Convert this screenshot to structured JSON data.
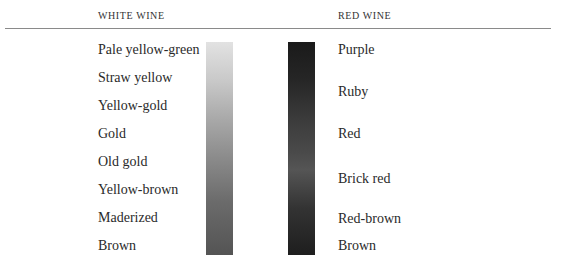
{
  "headers": {
    "white": "WHITE WINE",
    "red": "RED WINE"
  },
  "white_wine": {
    "labels": [
      "Pale yellow-green",
      "Straw yellow",
      "Yellow-gold",
      "Gold",
      "Old gold",
      "Yellow-brown",
      "Maderized",
      "Brown"
    ],
    "gradient_colors": [
      "#e2e2e2",
      "#c9c9c9",
      "#a9a9a9",
      "#8a8a8a",
      "#6b6b6b",
      "#545454"
    ]
  },
  "red_wine": {
    "labels": [
      "Purple",
      "Ruby",
      "Red",
      "Brick red",
      "Red-brown",
      "Brown"
    ],
    "gradient_colors": [
      "#1a1a1a",
      "#262626",
      "#3b3b3b",
      "#4a4a4a",
      "#555555",
      "#333333",
      "#1e1e1e"
    ]
  }
}
